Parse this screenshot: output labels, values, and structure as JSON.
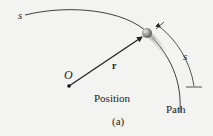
{
  "figure": {
    "path_start_label": "s",
    "origin_label": "O",
    "vector_label": "r",
    "arc_length_label": "s",
    "position_caption": "Position",
    "path_caption": "Path",
    "subfigure_label": "(a)"
  },
  "colors": {
    "background": "#f3f3f1",
    "line": "#2a2a2a",
    "particle": "#9a9a9a",
    "particle_shadow": "#b8b8b8"
  }
}
